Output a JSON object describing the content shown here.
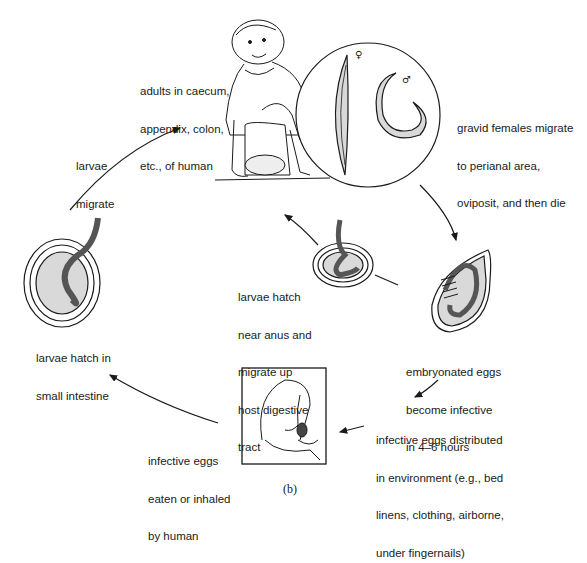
{
  "diagram": {
    "caption": "(b)",
    "stages": [
      {
        "id": "adults",
        "lines": [
          "adults in caecum,",
          "appendix, colon,",
          "etc., of human"
        ]
      },
      {
        "id": "gravid-females",
        "lines": [
          "gravid females migrate",
          "to perianal area,",
          "oviposit, and then die"
        ]
      },
      {
        "id": "embryonated-eggs",
        "lines": [
          "embryonated eggs",
          "become infective",
          "in 4–6 hours"
        ]
      },
      {
        "id": "eggs-distributed",
        "lines": [
          "infective eggs distributed",
          "in environment (e.g., bed",
          "linens, clothing, airborne,",
          "under fingernails)"
        ]
      },
      {
        "id": "eggs-eaten",
        "lines": [
          "infective eggs",
          "eaten or inhaled",
          "by human"
        ]
      },
      {
        "id": "larvae-hatch-intestine",
        "lines": [
          "larvae hatch in",
          "small intestine"
        ]
      },
      {
        "id": "larvae-migrate",
        "lines": [
          "larvae",
          "migrate"
        ]
      },
      {
        "id": "larvae-hatch-anus",
        "lines": [
          "larvae hatch",
          "near anus and",
          "migrate up",
          "host digestive",
          "tract"
        ]
      }
    ],
    "symbols": {
      "female": "♀",
      "male": "♂"
    },
    "colors": {
      "line": "#1a1a1a",
      "fill_light": "#d9d9d9",
      "fill_dark": "#8c8c8c"
    }
  }
}
